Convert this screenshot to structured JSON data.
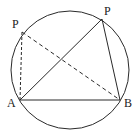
{
  "diagram": {
    "type": "geometry-circle-inscribed-triangles",
    "colors": {
      "stroke": "#2a2a2a",
      "background": "#ffffff"
    },
    "circle": {
      "cx": 70,
      "cy": 70,
      "r": 59
    },
    "points": {
      "A": {
        "label": "A",
        "x": 20,
        "y": 100,
        "label_x": 7,
        "label_y": 107
      },
      "B": {
        "label": "B",
        "x": 120,
        "y": 100,
        "label_x": 124,
        "label_y": 107
      },
      "P1": {
        "label": "P",
        "x": 102,
        "y": 19,
        "label_x": 104,
        "label_y": 15
      },
      "P2": {
        "label": "P",
        "x": 22,
        "y": 32,
        "label_x": 12,
        "label_y": 28
      }
    },
    "segments": [
      {
        "from": "A",
        "to": "B",
        "style": "solid"
      },
      {
        "from": "A",
        "to": "P1",
        "style": "solid"
      },
      {
        "from": "P1",
        "to": "B",
        "style": "solid"
      },
      {
        "from": "A",
        "to": "P2",
        "style": "dashed"
      },
      {
        "from": "P2",
        "to": "B",
        "style": "dashed"
      }
    ]
  }
}
